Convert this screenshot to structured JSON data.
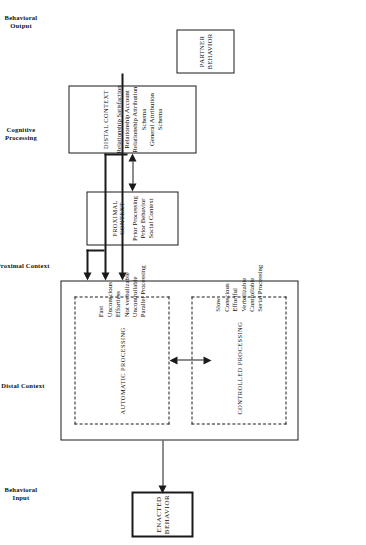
{
  "figure": {
    "orientation": "rotated-90-ccw",
    "ink_color": "#1a1a1a",
    "background_color": "#ffffff"
  },
  "section_labels": [
    {
      "id": "behavioral-output",
      "text": "Behavioral\nOutput"
    },
    {
      "id": "cognitive-processing",
      "text": "Cognitive\nProcessing"
    },
    {
      "id": "proximal-context",
      "text": "Proximal Context"
    },
    {
      "id": "distal-context",
      "text": "Distal Context"
    },
    {
      "id": "behavioral-input",
      "text": "Behavioral\nInput"
    }
  ],
  "nodes": {
    "enacted_behavior": {
      "title": "ENACTED\nBEHAVIOR"
    },
    "automatic_processing": {
      "title": "AUTOMATIC PROCESSING",
      "items": [
        "Fast",
        "Unconscious",
        "Effortless",
        "Not verbalizable",
        "Uncontrollable",
        "Parallel Processing"
      ]
    },
    "controlled_processing": {
      "title": "CONTROLLED PROCESSING",
      "items": [
        "Slow",
        "Conscious",
        "Effortful",
        "Verbalizable",
        "Controllable",
        "Serial Processing"
      ]
    },
    "proximal_context": {
      "title": "PROXIMAL CONTEXT",
      "items": [
        "Prior Processing",
        "Prior Behavior",
        "Social Context"
      ]
    },
    "distal_context": {
      "title": "DISTAL CONTEXT",
      "items": [
        "Relationship Satisfaction",
        "Relationship Account",
        "Relationship Attribution",
        "Schema",
        "General Attribution",
        "Schema"
      ]
    },
    "partner_behavior": {
      "title": "PARTNER\nBEHAVIOR"
    }
  },
  "connectors": [
    {
      "id": "cognitive-to-enacted",
      "style": "single-arrow"
    },
    {
      "id": "automatic-controlled-bidirectional",
      "style": "double-arrow"
    },
    {
      "id": "proximal-to-cognitive",
      "style": "single-arrow"
    },
    {
      "id": "distal-to-cognitive",
      "style": "single-arrow"
    },
    {
      "id": "partner-to-cognitive",
      "style": "single-arrow"
    },
    {
      "id": "distal-proximal-bidirectional",
      "style": "double-arrow"
    }
  ]
}
